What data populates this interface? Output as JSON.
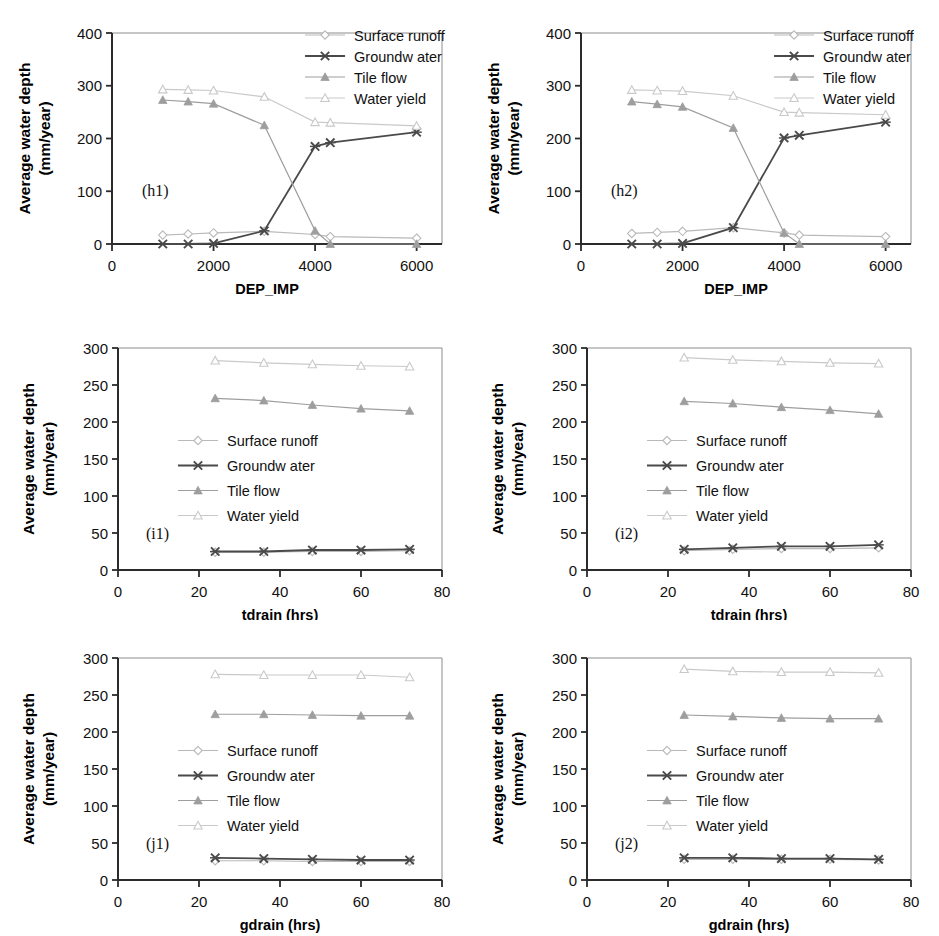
{
  "figure": {
    "width": 939,
    "height": 936,
    "background": "#ffffff",
    "series_names": [
      "Surface runoff",
      "Groundwater",
      "Tile flow",
      "Water yield"
    ],
    "colors": {
      "surface_runoff": "#b9b9b9",
      "groundwater": "#4a4a4a",
      "tile_flow": "#9e9e9e",
      "water_yield": "#c9c9c9",
      "axis": "#2b2b2b",
      "text": "#111111"
    },
    "legend": {
      "entries": [
        {
          "label": "Surface runoff",
          "marker": "open-diamond",
          "color": "#b9b9b9"
        },
        {
          "label": "Groundw ater",
          "marker": "x-cross",
          "color": "#4a4a4a"
        },
        {
          "label": "Tile flow",
          "marker": "filled-triangle",
          "color": "#9e9e9e"
        },
        {
          "label": "Water yield",
          "marker": "open-triangle",
          "color": "#c9c9c9"
        }
      ]
    },
    "shared_ylabel_line1": "Average water depth",
    "shared_ylabel_line2": "(mm/year)"
  },
  "chart_data": [
    {
      "type": "line",
      "tag": "(h1)",
      "panel_id": "h1",
      "title": "",
      "xlabel": "DEP_IMP",
      "ylabel": "Average water depth (mm/year)",
      "xlim": [
        0,
        6500
      ],
      "ylim": [
        0,
        400
      ],
      "xticks": [
        0,
        2000,
        4000,
        6000
      ],
      "xticklabels": [
        "0",
        "2000",
        "4000",
        "6000"
      ],
      "yticks": [
        0,
        100,
        200,
        300,
        400
      ],
      "yticklabels": [
        "0",
        "100",
        "200",
        "300",
        "400"
      ],
      "grid": false,
      "legend_position": "top-right",
      "x": [
        1000,
        1500,
        2000,
        3000,
        4000,
        4300,
        6000
      ],
      "series": [
        {
          "name": "Surface runoff",
          "marker": "open-diamond",
          "color": "#b9b9b9",
          "values": [
            17,
            19,
            21,
            24,
            18,
            14,
            11
          ]
        },
        {
          "name": "Groundwater",
          "marker": "x-cross",
          "color": "#4a4a4a",
          "values": [
            0,
            0,
            1,
            25,
            185,
            192,
            212
          ]
        },
        {
          "name": "Tile flow",
          "marker": "filled-triangle",
          "color": "#9e9e9e",
          "values": [
            273,
            270,
            266,
            225,
            25,
            0,
            0
          ]
        },
        {
          "name": "Water yield",
          "marker": "open-triangle",
          "color": "#c9c9c9",
          "values": [
            293,
            292,
            291,
            279,
            231,
            230,
            224
          ]
        }
      ]
    },
    {
      "type": "line",
      "tag": "(h2)",
      "panel_id": "h2",
      "title": "",
      "xlabel": "DEP_IMP",
      "ylabel": "Average water depth (mm/year)",
      "xlim": [
        0,
        6500
      ],
      "ylim": [
        0,
        400
      ],
      "xticks": [
        0,
        2000,
        4000,
        6000
      ],
      "xticklabels": [
        "0",
        "2000",
        "4000",
        "6000"
      ],
      "yticks": [
        0,
        100,
        200,
        300,
        400
      ],
      "yticklabels": [
        "0",
        "100",
        "200",
        "300",
        "400"
      ],
      "grid": false,
      "legend_position": "top-right",
      "x": [
        1000,
        1500,
        2000,
        3000,
        4000,
        4300,
        6000
      ],
      "series": [
        {
          "name": "Surface runoff",
          "marker": "open-diamond",
          "color": "#b9b9b9",
          "values": [
            20,
            22,
            24,
            31,
            21,
            17,
            14
          ]
        },
        {
          "name": "Groundwater",
          "marker": "x-cross",
          "color": "#4a4a4a",
          "values": [
            0,
            0,
            1,
            31,
            201,
            206,
            231
          ]
        },
        {
          "name": "Tile flow",
          "marker": "filled-triangle",
          "color": "#9e9e9e",
          "values": [
            270,
            265,
            260,
            220,
            21,
            0,
            0
          ]
        },
        {
          "name": "Water yield",
          "marker": "open-triangle",
          "color": "#c9c9c9",
          "values": [
            292,
            291,
            290,
            281,
            250,
            249,
            245
          ]
        }
      ]
    },
    {
      "type": "line",
      "tag": "(i1)",
      "panel_id": "i1",
      "title": "",
      "xlabel": "tdrain (hrs)",
      "ylabel": "Average water depth (mm/year)",
      "xlim": [
        0,
        80
      ],
      "ylim": [
        0,
        300
      ],
      "xticks": [
        0,
        20,
        40,
        60,
        80
      ],
      "xticklabels": [
        "0",
        "20",
        "40",
        "60",
        "80"
      ],
      "yticks": [
        0,
        50,
        100,
        150,
        200,
        250,
        300
      ],
      "yticklabels": [
        "0",
        "50",
        "100",
        "150",
        "200",
        "250",
        "300"
      ],
      "grid": false,
      "legend_position": "middle-left",
      "x": [
        24,
        36,
        48,
        60,
        72
      ],
      "series": [
        {
          "name": "Surface runoff",
          "marker": "open-diamond",
          "color": "#b9b9b9",
          "values": [
            24,
            24,
            25,
            25,
            26
          ]
        },
        {
          "name": "Groundwater",
          "marker": "x-cross",
          "color": "#4a4a4a",
          "values": [
            25,
            25,
            27,
            27,
            28
          ]
        },
        {
          "name": "Tile flow",
          "marker": "filled-triangle",
          "color": "#9e9e9e",
          "values": [
            232,
            229,
            223,
            218,
            215
          ]
        },
        {
          "name": "Water yield",
          "marker": "open-triangle",
          "color": "#c9c9c9",
          "values": [
            283,
            280,
            278,
            276,
            275
          ]
        }
      ]
    },
    {
      "type": "line",
      "tag": "(i2)",
      "panel_id": "i2",
      "title": "",
      "xlabel": "tdrain (hrs)",
      "ylabel": "Average water depth (mm/year)",
      "xlim": [
        0,
        80
      ],
      "ylim": [
        0,
        300
      ],
      "xticks": [
        0,
        20,
        40,
        60,
        80
      ],
      "xticklabels": [
        "0",
        "20",
        "40",
        "60",
        "80"
      ],
      "yticks": [
        0,
        50,
        100,
        150,
        200,
        250,
        300
      ],
      "yticklabels": [
        "0",
        "50",
        "100",
        "150",
        "200",
        "250",
        "300"
      ],
      "grid": false,
      "legend_position": "middle-left",
      "x": [
        24,
        36,
        48,
        60,
        72
      ],
      "series": [
        {
          "name": "Surface runoff",
          "marker": "open-diamond",
          "color": "#b9b9b9",
          "values": [
            26,
            28,
            29,
            29,
            30
          ]
        },
        {
          "name": "Groundwater",
          "marker": "x-cross",
          "color": "#4a4a4a",
          "values": [
            28,
            30,
            32,
            32,
            34
          ]
        },
        {
          "name": "Tile flow",
          "marker": "filled-triangle",
          "color": "#9e9e9e",
          "values": [
            228,
            225,
            220,
            216,
            211
          ]
        },
        {
          "name": "Water yield",
          "marker": "open-triangle",
          "color": "#c9c9c9",
          "values": [
            287,
            284,
            282,
            280,
            279
          ]
        }
      ]
    },
    {
      "type": "line",
      "tag": "(j1)",
      "panel_id": "j1",
      "title": "",
      "xlabel": "gdrain (hrs)",
      "ylabel": "Average water depth (mm/year)",
      "xlim": [
        0,
        80
      ],
      "ylim": [
        0,
        300
      ],
      "xticks": [
        0,
        20,
        40,
        60,
        80
      ],
      "xticklabels": [
        "0",
        "20",
        "40",
        "60",
        "80"
      ],
      "yticks": [
        0,
        50,
        100,
        150,
        200,
        250,
        300
      ],
      "yticklabels": [
        "0",
        "50",
        "100",
        "150",
        "200",
        "250",
        "300"
      ],
      "grid": false,
      "legend_position": "middle-left",
      "x": [
        24,
        36,
        48,
        60,
        72
      ],
      "series": [
        {
          "name": "Surface runoff",
          "marker": "open-diamond",
          "color": "#b9b9b9",
          "values": [
            26,
            26,
            25,
            25,
            25
          ]
        },
        {
          "name": "Groundwater",
          "marker": "x-cross",
          "color": "#4a4a4a",
          "values": [
            30,
            29,
            28,
            27,
            27
          ]
        },
        {
          "name": "Tile flow",
          "marker": "filled-triangle",
          "color": "#9e9e9e",
          "values": [
            224,
            224,
            223,
            222,
            222
          ]
        },
        {
          "name": "Water yield",
          "marker": "open-triangle",
          "color": "#c9c9c9",
          "values": [
            278,
            277,
            277,
            277,
            274
          ]
        }
      ]
    },
    {
      "type": "line",
      "tag": "(j2)",
      "panel_id": "j2",
      "title": "",
      "xlabel": "gdrain (hrs)",
      "ylabel": "Average water depth (mm/year)",
      "xlim": [
        0,
        80
      ],
      "ylim": [
        0,
        300
      ],
      "xticks": [
        0,
        20,
        40,
        60,
        80
      ],
      "xticklabels": [
        "0",
        "20",
        "40",
        "60",
        "80"
      ],
      "yticks": [
        0,
        50,
        100,
        150,
        200,
        250,
        300
      ],
      "yticklabels": [
        "0",
        "50",
        "100",
        "150",
        "200",
        "250",
        "300"
      ],
      "grid": false,
      "legend_position": "middle-left",
      "x": [
        24,
        36,
        48,
        60,
        72
      ],
      "series": [
        {
          "name": "Surface runoff",
          "marker": "open-diamond",
          "color": "#b9b9b9",
          "values": [
            28,
            28,
            28,
            28,
            27
          ]
        },
        {
          "name": "Groundwater",
          "marker": "x-cross",
          "color": "#4a4a4a",
          "values": [
            30,
            30,
            29,
            29,
            28
          ]
        },
        {
          "name": "Tile flow",
          "marker": "filled-triangle",
          "color": "#9e9e9e",
          "values": [
            223,
            221,
            219,
            218,
            218
          ]
        },
        {
          "name": "Water yield",
          "marker": "open-triangle",
          "color": "#c9c9c9",
          "values": [
            285,
            282,
            281,
            281,
            280
          ]
        }
      ]
    }
  ],
  "panel_layout": [
    {
      "id": "h1",
      "left": 0,
      "top": 0,
      "width": 470,
      "height": 300
    },
    {
      "id": "h2",
      "left": 469,
      "top": 0,
      "width": 470,
      "height": 300
    },
    {
      "id": "i1",
      "left": 0,
      "top": 320,
      "width": 470,
      "height": 300
    },
    {
      "id": "i2",
      "left": 469,
      "top": 320,
      "width": 470,
      "height": 300
    },
    {
      "id": "j1",
      "left": 0,
      "top": 630,
      "width": 470,
      "height": 306
    },
    {
      "id": "j2",
      "left": 469,
      "top": 630,
      "width": 470,
      "height": 306
    }
  ]
}
